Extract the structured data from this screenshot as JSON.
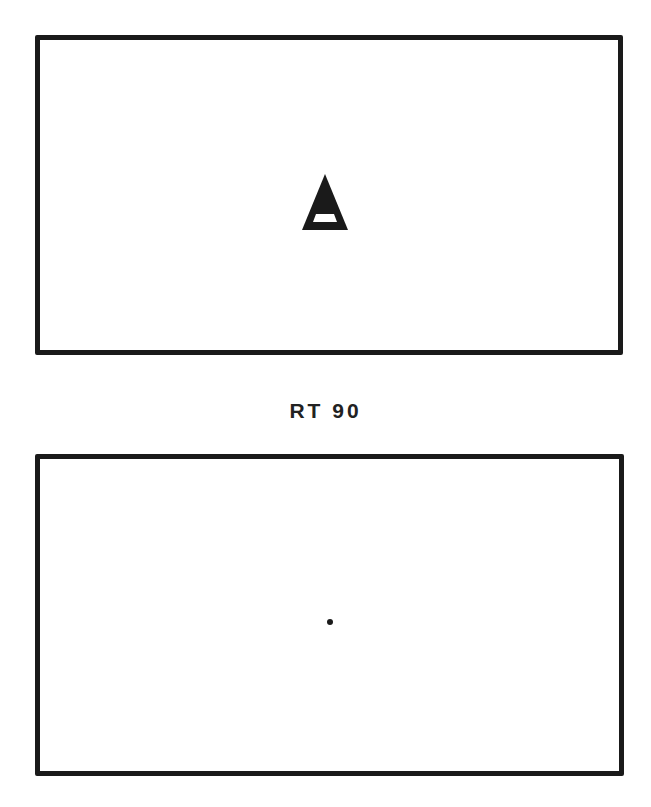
{
  "figure": {
    "panels": [
      {
        "id": "before",
        "content": "turtle",
        "turtle_icon": "triangle-turtle-icon",
        "turtle_heading": "up"
      },
      {
        "id": "after",
        "content": "dot",
        "dot_icon": "center-dot-icon"
      }
    ],
    "command": "RT 90",
    "colors": {
      "ink": "#1a1a1a",
      "paper": "#ffffff"
    }
  }
}
